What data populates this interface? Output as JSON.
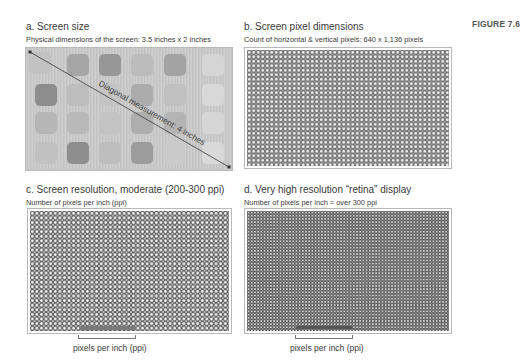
{
  "figure_label": "FIGURE 7.6",
  "panels": [
    {
      "id": "a",
      "title": "a.  Screen size",
      "subtitle": "Physical dimensions of the screen: 3.5 inches x 2 inches",
      "diagonal_label": "Diagonal measurement: 4 inches",
      "colors": {
        "screen_bg": "#c9c9c9",
        "icon_dark": "#8f8f8f",
        "icon_mid": "#a9a9a9",
        "icon_light": "#d6d6d6",
        "line": "#4a4a4a"
      }
    },
    {
      "id": "b",
      "title": "b.  Screen pixel dimensions",
      "subtitle": "Count of horizontal & vertical pixels: 640 x 1,136 pixels"
    },
    {
      "id": "c",
      "title": "c.  Screen resolution, moderate (200-300 ppi)",
      "subtitle": "Number of pixels per inch (ppi)",
      "bracket_label": "pixels per inch (ppi)"
    },
    {
      "id": "d",
      "title": "d.  Very high resolution “retina” display",
      "subtitle": "Number of pixels per inch = over 300 ppi",
      "bracket_label": "pixels per inch (ppi)"
    }
  ]
}
